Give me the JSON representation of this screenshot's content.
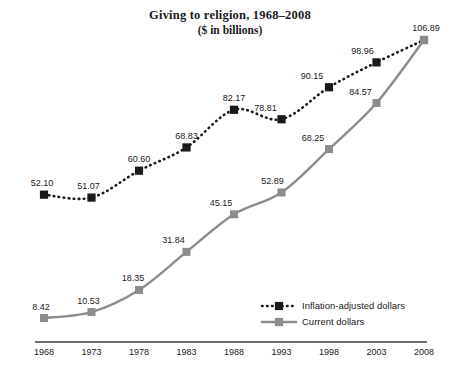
{
  "chart_data": {
    "type": "line",
    "title": "Giving to religion, 1968–2008",
    "subtitle": "($ in billions)",
    "xlabel": "",
    "ylabel": "",
    "grid": false,
    "legend_position": "bottom-right",
    "categories": [
      "1968",
      "1973",
      "1978",
      "1983",
      "1988",
      "1993",
      "1998",
      "2003",
      "2008"
    ],
    "x": [
      1968,
      1973,
      1978,
      1983,
      1988,
      1993,
      1998,
      2003,
      2008
    ],
    "xlim": [
      1968,
      2008
    ],
    "ylim": [
      0,
      112
    ],
    "series": [
      {
        "name": "Inflation-adjusted dollars",
        "style": "dotted",
        "color": "#1a1a1a",
        "marker": "square",
        "values": [
          52.1,
          51.07,
          60.6,
          68.83,
          82.17,
          78.81,
          90.15,
          98.96,
          106.89
        ],
        "labels": [
          "52.10",
          "51.07",
          "60.60",
          "68.83",
          "82.17",
          "78.81",
          "90.15",
          "98.96",
          "106.89"
        ]
      },
      {
        "name": "Current dollars",
        "style": "solid",
        "color": "#8c8c8c",
        "marker": "square",
        "values": [
          8.42,
          10.53,
          18.35,
          31.84,
          45.15,
          52.89,
          68.25,
          84.57,
          106.89
        ],
        "labels": [
          "8.42",
          "10.53",
          "18.35",
          "31.84",
          "45.15",
          "52.89",
          "68.25",
          "84.57",
          "106.89"
        ]
      }
    ]
  },
  "legend": {
    "items": [
      {
        "label": "Inflation-adjusted dollars"
      },
      {
        "label": "Current dollars"
      }
    ]
  },
  "colors": {
    "inflation_adjusted": "#1a1a1a",
    "current": "#8c8c8c",
    "axis": "#3d3d3d",
    "background": "#ffffff"
  }
}
